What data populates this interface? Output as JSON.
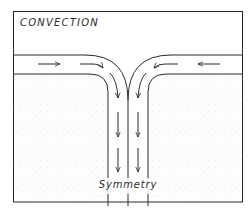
{
  "diagram": {
    "title": "CONVECTION",
    "label": "Symmetry",
    "colors": {
      "line": "#2a2a2a",
      "background": "#ffffff",
      "stipple": "#9a9a9a"
    },
    "flow_arrows": {
      "top_layer_left": [
        "right",
        "right-curving-down"
      ],
      "top_layer_right": [
        "left",
        "left-curving-down"
      ],
      "channel_left": [
        "down",
        "down",
        "down"
      ],
      "channel_right": [
        "down",
        "down",
        "down"
      ]
    }
  }
}
